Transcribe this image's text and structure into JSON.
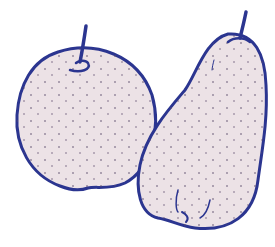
{
  "image": {
    "subject": "Two pears illustration",
    "objects": [
      {
        "name": "round pear",
        "position": "left"
      },
      {
        "name": "tall pear",
        "position": "right"
      }
    ],
    "colors": {
      "outline": "#2b3590",
      "fill": "#ece2e6",
      "speckle": "#5a4a6a",
      "background": "#ffffff"
    }
  }
}
